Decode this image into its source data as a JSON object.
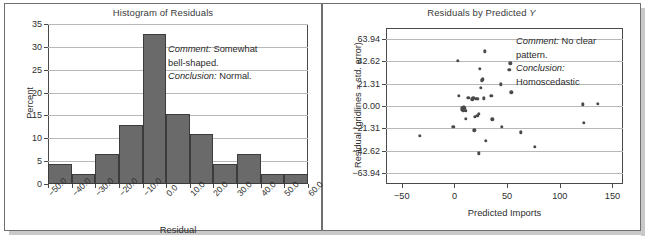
{
  "figure": {
    "width": 655,
    "height": 247,
    "background": "#ffffff",
    "frame_color": "#6f6f6f",
    "shadow_color": "#c9c9c9"
  },
  "panels": [
    {
      "id": "histogram",
      "title": "Histogram of Residuals",
      "annotation": {
        "line1_label": "Comment:",
        "line1_text": " Somewhat",
        "line2_text": "bell-shaped.",
        "line3_label": "Conclusion:",
        "line3_text": " Normal."
      }
    },
    {
      "id": "scatter",
      "title_main": "Residuals by Predicted ",
      "title_italic": "Y",
      "annotation": {
        "line1_label": "Comment:",
        "line1_text": " No clear",
        "line2_text": "pattern.",
        "line3_label": "Conclusion:",
        "line4_text": "Homoscedastic"
      }
    }
  ],
  "chart_data": [
    {
      "type": "bar",
      "title": "Histogram of Residuals",
      "xlabel": "Residual",
      "ylabel": "Percent",
      "ylim": [
        0,
        35
      ],
      "yticks": [
        0,
        5,
        10,
        15,
        20,
        25,
        30,
        35
      ],
      "xlim": [
        -50,
        60
      ],
      "xticks": [
        -50.0,
        -40.0,
        -30.0,
        -20.0,
        -10.0,
        0.0,
        10.0,
        20.0,
        30.0,
        40.0,
        50.0,
        60.0
      ],
      "xtick_labels": [
        "−50.0",
        "−40.0",
        "−30.0",
        "−20.0",
        "−10.0",
        "0.0",
        "10.0",
        "20.0",
        "30.0",
        "40.0",
        "50.0",
        "60.0"
      ],
      "bin_width": 10,
      "bin_starts": [
        -50,
        -40,
        -30,
        -20,
        -10,
        0,
        10,
        20,
        30,
        40,
        50
      ],
      "categories": [
        "-50 to -40",
        "-40 to -30",
        "-30 to -20",
        "-20 to -10",
        "-10 to 0",
        "0 to 10",
        "10 to 20",
        "20 to 30",
        "30 to 40",
        "40 to 50",
        "50 to 60"
      ],
      "values": [
        4.4,
        2.2,
        6.5,
        13.0,
        32.8,
        15.3,
        11.0,
        4.4,
        6.5,
        2.2,
        2.2
      ],
      "grid": true,
      "bar_fill": "#6a6a6a",
      "bar_edge": "#3c3c3c",
      "legend": "none"
    },
    {
      "type": "scatter",
      "title": "Residuals by Predicted Y",
      "xlabel": "Predicted Imports",
      "ylabel": "Residual (gridlines = std. error)",
      "xlim": [
        -65,
        160
      ],
      "xticks": [
        -50,
        0,
        50,
        100,
        150
      ],
      "xtick_labels": [
        "−50",
        "0",
        "50",
        "100",
        "150"
      ],
      "ylim": [
        -74.0,
        74.0
      ],
      "yticks": [
        63.94,
        42.62,
        21.31,
        0.0,
        -21.31,
        -42.62,
        -63.94
      ],
      "ytick_labels": [
        "63.94",
        "42.62",
        "21.31",
        "0.00",
        "−21.31",
        "−42.62",
        "−63.94"
      ],
      "grid": true,
      "point_color": "#4a4a4a",
      "legend": "none",
      "points": [
        [
          -33,
          -28
        ],
        [
          -1,
          -19.5
        ],
        [
          3,
          42.6
        ],
        [
          4,
          9.5
        ],
        [
          7,
          -3.5
        ],
        [
          7.5,
          -1.5
        ],
        [
          8,
          -2.5
        ],
        [
          8.5,
          -4.0
        ],
        [
          9,
          -1.0
        ],
        [
          9.5,
          -3.0
        ],
        [
          10,
          -2.0
        ],
        [
          10.5,
          -4.5
        ],
        [
          11,
          -12
        ],
        [
          13,
          8.0
        ],
        [
          17,
          6.5
        ],
        [
          18,
          7.5
        ],
        [
          19,
          -23
        ],
        [
          19.5,
          -10.5
        ],
        [
          20,
          7.0
        ],
        [
          21,
          6.8
        ],
        [
          21.5,
          -9.5
        ],
        [
          22,
          6.9
        ],
        [
          23,
          -7.5
        ],
        [
          23,
          -45
        ],
        [
          24,
          35.5
        ],
        [
          25,
          17.0
        ],
        [
          26,
          24.5
        ],
        [
          27,
          25.5
        ],
        [
          28,
          7.2
        ],
        [
          29,
          52.0
        ],
        [
          30,
          -33
        ],
        [
          35,
          9.5
        ],
        [
          36,
          -12.5
        ],
        [
          44,
          20.5
        ],
        [
          45,
          -19.5
        ],
        [
          52,
          34.5
        ],
        [
          53,
          40.5
        ],
        [
          54,
          13.0
        ],
        [
          63,
          -25
        ],
        [
          76,
          -39
        ],
        [
          122,
          1.5
        ],
        [
          123,
          -16
        ],
        [
          136,
          1.8
        ]
      ]
    }
  ]
}
